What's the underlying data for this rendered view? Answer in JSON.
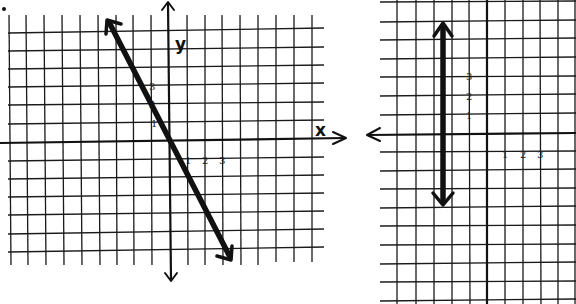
{
  "figure": {
    "bullet": "•",
    "graphs": [
      {
        "id": "left",
        "description": "Line through origin with slope -2",
        "axis_labels": {
          "x": "x",
          "y": "y"
        },
        "x_tick_labels": [
          "1",
          "2",
          "3"
        ],
        "y_tick_labels": [
          "1",
          "2",
          "3"
        ],
        "line": {
          "equation": "y = -2x",
          "from": [
            -3.4,
            6.8
          ],
          "to": [
            3.4,
            -6.7
          ]
        }
      },
      {
        "id": "right",
        "description": "Vertical line x = -2.5",
        "axis_labels": {
          "x": "",
          "y": ""
        },
        "x_tick_labels": [
          "1",
          "2",
          "3"
        ],
        "y_tick_labels": [
          "1",
          "2",
          "3"
        ],
        "line": {
          "equation": "x = -2.5",
          "from": [
            -2.5,
            6.2
          ],
          "to": [
            -2.5,
            -4
          ]
        }
      }
    ]
  },
  "colors": {
    "ink": "#111111",
    "grid": "#1a1a1a",
    "paper": "#ffffff"
  }
}
